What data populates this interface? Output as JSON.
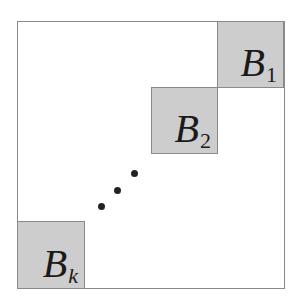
{
  "diagram": {
    "colors": {
      "block_fill": "#cdcdcd",
      "border": "#8a8a8a",
      "dots": "#222222"
    },
    "blocks": [
      {
        "id": "B1",
        "letter": "B",
        "subscript": "1"
      },
      {
        "id": "B2",
        "letter": "B",
        "subscript": "2"
      },
      {
        "id": "Bk",
        "letter": "B",
        "subscript": "k"
      }
    ],
    "ellipsis": "diagonal dots"
  }
}
